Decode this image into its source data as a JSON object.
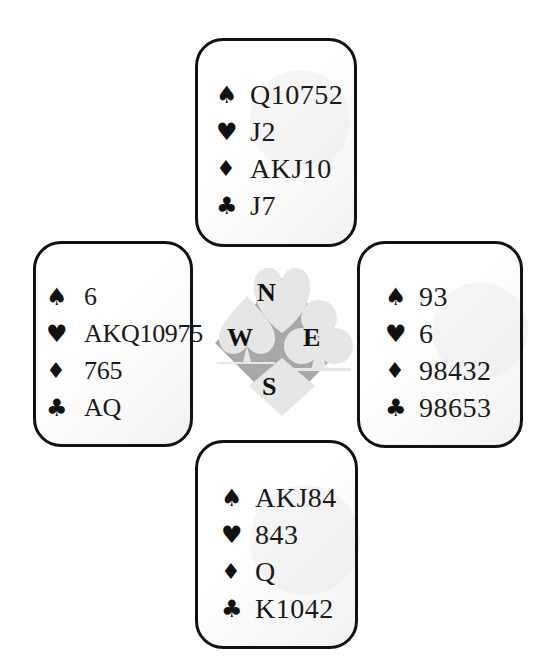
{
  "diagram": {
    "type": "bridge-deal",
    "suit_symbols": {
      "spades": "♠",
      "hearts": "♥",
      "diamonds": "♦",
      "clubs": "♣"
    },
    "compass": {
      "north": "N",
      "west": "W",
      "east": "E",
      "south": "S"
    },
    "hands": {
      "north": {
        "spades": "Q10752",
        "hearts": "J2",
        "diamonds": "AKJ10",
        "clubs": "J7"
      },
      "west": {
        "spades": "6",
        "hearts": "AKQ10975",
        "diamonds": "765",
        "clubs": "AQ"
      },
      "east": {
        "spades": "93",
        "hearts": "6",
        "diamonds": "98432",
        "clubs": "98653"
      },
      "south": {
        "spades": "AKJ84",
        "hearts": "843",
        "diamonds": "Q",
        "clubs": "K1042"
      }
    },
    "colors": {
      "border": "#111111",
      "text": "#1a1a1a",
      "compass_light": "#e6e6e6",
      "compass_dark": "#a8a8a8"
    }
  }
}
